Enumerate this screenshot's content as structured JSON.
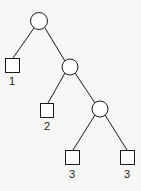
{
  "diagram": {
    "type": "tree",
    "colors": {
      "stroke": "#1a1a1a",
      "background": "#f7f7f5"
    },
    "nodes": [
      {
        "id": "c1",
        "shape": "circle"
      },
      {
        "id": "c2",
        "shape": "circle"
      },
      {
        "id": "c3",
        "shape": "circle"
      },
      {
        "id": "s1",
        "shape": "square",
        "label": "1"
      },
      {
        "id": "s2",
        "shape": "square",
        "label": "2"
      },
      {
        "id": "s3a",
        "shape": "square",
        "label": "3"
      },
      {
        "id": "s3b",
        "shape": "square",
        "label": "3"
      }
    ],
    "edges": [
      [
        "c1",
        "s1"
      ],
      [
        "c1",
        "c2"
      ],
      [
        "c2",
        "s2"
      ],
      [
        "c2",
        "c3"
      ],
      [
        "c3",
        "s3a"
      ],
      [
        "c3",
        "s3b"
      ]
    ]
  }
}
